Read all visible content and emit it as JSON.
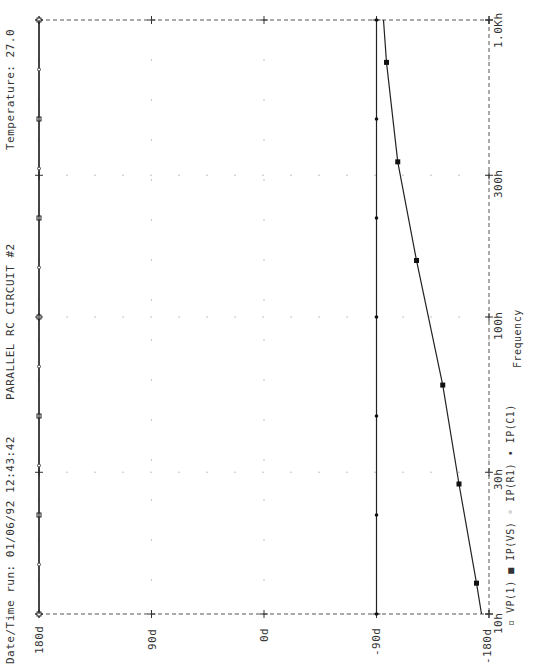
{
  "header": {
    "title": "PARALLEL RC CIRCUIT #2",
    "datetime": "Date/Time run: 01/06/92  12:43:42",
    "temperature": "Temperature:  27.0"
  },
  "axes": {
    "x_label": "Frequency",
    "x_ticks": [
      "10h",
      "30h",
      "100h",
      "300h",
      "1.0Kh"
    ],
    "y_ticks": [
      "180d",
      "90d",
      "0d",
      "-90d",
      "-180d"
    ]
  },
  "legend": [
    {
      "marker": "open-square",
      "label": "VP(1)"
    },
    {
      "marker": "filled-square",
      "label": "IP(VS)"
    },
    {
      "marker": "small-circle",
      "label": "IP(R1)"
    },
    {
      "marker": "diamond",
      "label": "IP(C1)"
    }
  ],
  "chart_data": {
    "type": "line",
    "title": "PARALLEL RC CIRCUIT #2",
    "xlabel": "Frequency",
    "ylabel": "Phase (degrees)",
    "x_scale": "log",
    "xlim": [
      10,
      1000
    ],
    "ylim": [
      -180,
      180
    ],
    "x_ticks": [
      10,
      30,
      100,
      300,
      1000
    ],
    "x_tick_labels": [
      "10h",
      "30h",
      "100h",
      "300h",
      "1.0Kh"
    ],
    "y_ticks": [
      180,
      90,
      0,
      -90,
      -180
    ],
    "y_tick_labels": [
      "180d",
      "90d",
      "0d",
      "-90d",
      "-180d"
    ],
    "grid": "dotted",
    "orientation": "rotated 90deg counter-clockwise",
    "legend_position": "bottom-right",
    "series": [
      {
        "name": "VP(1)",
        "marker": "open-square",
        "x": [
          10,
          1000
        ],
        "values": [
          180,
          180
        ]
      },
      {
        "name": "IP(VS)",
        "marker": "filled-square",
        "x": [
          10,
          12.7,
          27.4,
          59,
          155,
          333,
          720,
          1000
        ],
        "values": [
          -174,
          -170,
          -156,
          -143,
          -122,
          -107,
          -98,
          -95.6
        ]
      },
      {
        "name": "IP(R1)",
        "marker": "small-circle",
        "x": [
          10,
          1000
        ],
        "values": [
          180,
          180
        ]
      },
      {
        "name": "IP(C1)",
        "marker": "diamond",
        "x": [
          10,
          1000
        ],
        "values": [
          -90,
          -90
        ]
      }
    ],
    "annotations": [
      "Date/Time run: 01/06/92  12:43:42",
      "Temperature:  27.0"
    ]
  }
}
